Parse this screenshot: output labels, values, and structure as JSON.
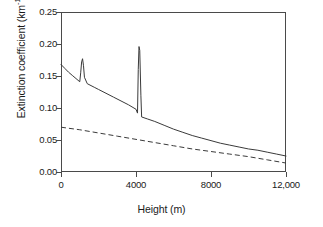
{
  "chart_data": {
    "type": "line",
    "title": "",
    "subtitle": "",
    "xlabel": "Height (m)",
    "ylabel": "Extinction coefficient (km⁻¹)",
    "ylabel_main": "Extinction coefficient (km",
    "ylabel_exponent": "-1",
    "ylabel_close": ")",
    "xlim": [
      0,
      12000
    ],
    "ylim": [
      0.0,
      0.25
    ],
    "xticks": [
      0,
      4000,
      8000,
      12000
    ],
    "xtick_labels": [
      "0",
      "4000",
      "8000",
      "12,000"
    ],
    "yticks": [
      0.0,
      0.05,
      0.1,
      0.15,
      0.2,
      0.25
    ],
    "ytick_labels": [
      "0.00",
      "0.05",
      "0.10",
      "0.15",
      "0.20",
      "0.25"
    ],
    "grid": false,
    "legend": "none",
    "frame": "full-box",
    "line_color": "#3a3a3a",
    "axis_color": "#4a4a4a",
    "background": "#ffffff",
    "series": [
      {
        "name": "solid-curve",
        "style": "solid",
        "color": "#3a3a3a",
        "x": [
          0,
          200,
          400,
          600,
          800,
          1000,
          1050,
          1100,
          1150,
          1200,
          1250,
          1400,
          1600,
          1800,
          2000,
          2400,
          2800,
          3200,
          3600,
          4000,
          4080,
          4120,
          4160,
          4200,
          4260,
          4300,
          4600,
          5000,
          5500,
          6000,
          6500,
          7000,
          7500,
          8000,
          8500,
          9000,
          9500,
          10000,
          10500,
          11000,
          11500,
          12000
        ],
        "y": [
          0.168,
          0.162,
          0.156,
          0.151,
          0.146,
          0.141,
          0.155,
          0.172,
          0.177,
          0.166,
          0.148,
          0.138,
          0.135,
          0.132,
          0.129,
          0.123,
          0.117,
          0.111,
          0.105,
          0.098,
          0.092,
          0.16,
          0.196,
          0.19,
          0.12,
          0.086,
          0.083,
          0.079,
          0.073,
          0.067,
          0.062,
          0.057,
          0.053,
          0.049,
          0.045,
          0.042,
          0.039,
          0.036,
          0.034,
          0.031,
          0.028,
          0.025
        ]
      },
      {
        "name": "dashed-curve",
        "style": "dashed",
        "color": "#3a3a3a",
        "x": [
          0,
          1000,
          2000,
          3000,
          4000,
          5000,
          6000,
          7000,
          8000,
          9000,
          10000,
          11000,
          12000
        ],
        "y": [
          0.07,
          0.066,
          0.061,
          0.056,
          0.051,
          0.046,
          0.041,
          0.036,
          0.032,
          0.028,
          0.024,
          0.019,
          0.014
        ]
      }
    ],
    "annotations": [
      {
        "name": "spike-1",
        "x": 1150,
        "y": 0.177,
        "note": "narrow peak near 1150 m"
      },
      {
        "name": "spike-2",
        "x": 4160,
        "y": 0.196,
        "note": "narrow peak near 4160 m"
      }
    ]
  }
}
